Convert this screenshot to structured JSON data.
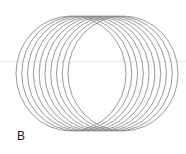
{
  "figure": {
    "panel_label": "B",
    "ellipse_count": 10,
    "stroke_color": "#8c8c8c",
    "ellipse": {
      "rx": 55,
      "ry": 57.5,
      "cy": 73.5,
      "cx_start": 71,
      "cx_end": 123
    },
    "top_fragment_text": "· · ·"
  }
}
